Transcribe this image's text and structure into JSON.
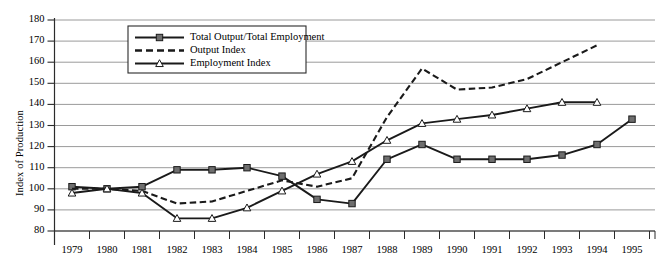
{
  "chart_data": {
    "type": "line",
    "title": "",
    "xlabel": "",
    "ylabel": "Index of Production",
    "ylim": [
      80,
      180
    ],
    "ytick_step": 10,
    "yticks": [
      80,
      90,
      100,
      110,
      120,
      130,
      140,
      150,
      160,
      170,
      180
    ],
    "grid": true,
    "grid_axis": "y",
    "legend_position": "top-center-inside",
    "legend_border": true,
    "categories": [
      1979,
      1980,
      1981,
      1982,
      1983,
      1984,
      1985,
      1986,
      1987,
      1988,
      1989,
      1990,
      1991,
      1992,
      1993,
      1994,
      1995
    ],
    "xtick_labels": [
      "1979",
      "1980",
      "1981",
      "1982",
      "1983",
      "1984",
      "1985",
      "1986",
      "1987",
      "1988",
      "1989",
      "1990",
      "1991",
      "1992",
      "1993",
      "1994",
      "1995"
    ],
    "series": [
      {
        "name": "Total Output/Total Employment",
        "marker": "square",
        "linestyle": "solid",
        "color": "#1a1a1a",
        "marker_color": "#6e6e6e",
        "values": [
          101,
          100,
          101,
          109,
          109,
          110,
          106,
          95,
          93,
          114,
          121,
          114,
          114,
          114,
          116,
          121,
          133
        ]
      },
      {
        "name": "Output Index",
        "marker": "none",
        "linestyle": "dashed",
        "color": "#1a1a1a",
        "marker_color": "#1a1a1a",
        "values": [
          100,
          100,
          99,
          93,
          94,
          99,
          104,
          101,
          105,
          134,
          157,
          147,
          148,
          152,
          160,
          168,
          null
        ]
      },
      {
        "name": "Employment Index",
        "marker": "triangle",
        "linestyle": "solid",
        "color": "#1a1a1a",
        "marker_color": "#8a8a8a",
        "values": [
          98,
          100,
          98,
          86,
          86,
          91,
          99,
          107,
          113,
          123,
          131,
          133,
          135,
          138,
          141,
          141,
          null
        ]
      }
    ],
    "colors": {
      "axis": "#2b2b2b",
      "grid": "#9a9a9a",
      "background": "#ffffff",
      "text": "#111111"
    }
  }
}
